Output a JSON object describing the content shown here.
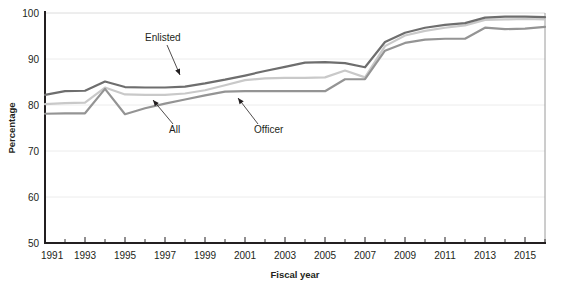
{
  "chart_data": {
    "type": "line",
    "title": "",
    "xlabel": "Fiscal year",
    "ylabel": "Percentage",
    "xlim": [
      1991,
      2016
    ],
    "ylim": [
      50,
      100
    ],
    "yticks": [
      50,
      60,
      70,
      80,
      90,
      100
    ],
    "xticks": [
      1991,
      1993,
      1995,
      1997,
      1999,
      2001,
      2003,
      2005,
      2007,
      2009,
      2011,
      2013,
      2015
    ],
    "xticks_minor": [
      1992,
      1994,
      1996,
      1998,
      2000,
      2002,
      2004,
      2006,
      2008,
      2010,
      2012,
      2014,
      2016
    ],
    "x": [
      1991,
      1992,
      1993,
      1994,
      1995,
      1996,
      1997,
      1998,
      1999,
      2000,
      2001,
      2002,
      2003,
      2004,
      2005,
      2006,
      2007,
      2008,
      2009,
      2010,
      2011,
      2012,
      2013,
      2014,
      2015,
      2016
    ],
    "grid": "horizontal",
    "legend_position": "inline-annotations",
    "series": [
      {
        "name": "Enlisted",
        "color": "#6e6e6e",
        "values": [
          82.2,
          83.0,
          83.1,
          85.1,
          83.9,
          83.8,
          83.8,
          84.0,
          84.7,
          85.5,
          86.4,
          87.4,
          88.3,
          89.2,
          89.3,
          89.1,
          88.2,
          93.7,
          95.7,
          96.8,
          97.4,
          97.8,
          99.0,
          99.2,
          99.2,
          99.1
        ]
      },
      {
        "name": "All",
        "color": "#c9c9c9",
        "values": [
          80.2,
          80.4,
          80.5,
          83.8,
          82.3,
          82.2,
          82.2,
          82.5,
          83.2,
          84.3,
          85.4,
          85.8,
          85.9,
          85.9,
          86.0,
          87.5,
          86.0,
          92.8,
          95.1,
          96.1,
          96.8,
          97.3,
          98.5,
          98.6,
          98.7,
          98.6
        ]
      },
      {
        "name": "Officer",
        "color": "#949494",
        "values": [
          78.1,
          78.2,
          78.2,
          83.5,
          78.0,
          79.3,
          80.3,
          81.2,
          82.1,
          82.9,
          83.0,
          83.0,
          83.0,
          83.0,
          83.0,
          85.6,
          85.6,
          91.8,
          93.5,
          94.2,
          94.4,
          94.4,
          96.8,
          96.5,
          96.6,
          97.0
        ]
      }
    ],
    "annotations": [
      {
        "label": "Enlisted",
        "series": "Enlisted",
        "text_x": 145,
        "text_y": 41,
        "point_x": 180,
        "point_y": 75
      },
      {
        "label": "All",
        "series": "All",
        "text_x": 169,
        "text_y": 133,
        "point_x": 153,
        "point_y": 100
      },
      {
        "label": "Officer",
        "series": "Officer",
        "text_x": 254,
        "text_y": 133,
        "point_x": 238,
        "point_y": 98
      }
    ]
  },
  "axes": {
    "y_title": "Percentage",
    "x_title": "Fiscal year",
    "y_tick_labels": [
      "100",
      "90",
      "80",
      "70",
      "60",
      "50"
    ],
    "x_tick_labels": [
      "1991",
      "1993",
      "1995",
      "1997",
      "1999",
      "2001",
      "2003",
      "2005",
      "2007",
      "2009",
      "2011",
      "2013",
      "2015"
    ]
  },
  "colors": {
    "enlisted": "#6e6e6e",
    "all": "#c9c9c9",
    "officer": "#949494",
    "axis": "#231f20",
    "gridline": "#e8e8e8",
    "background": "#ffffff"
  },
  "caption": {
    "footnote": ""
  }
}
